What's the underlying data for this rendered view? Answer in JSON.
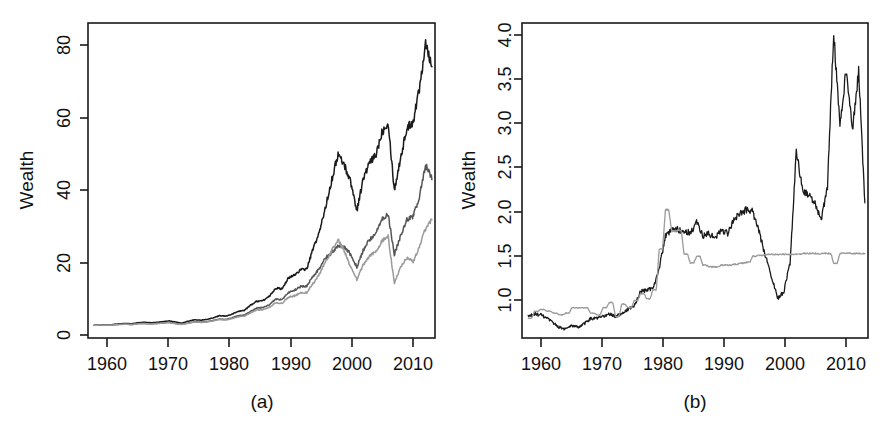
{
  "figure": {
    "panels": [
      {
        "id": "panel-a",
        "caption": "(a)",
        "ylabel": "Wealth",
        "xlabel": "",
        "y_ticks": [
          "0",
          "20",
          "40",
          "60",
          "80"
        ],
        "x_ticks": [
          "1960",
          "1970",
          "1980",
          "1990",
          "2000",
          "2010"
        ]
      },
      {
        "id": "panel-b",
        "caption": "(b)",
        "ylabel": "Wealth",
        "xlabel": "",
        "y_ticks": [
          "1.0",
          "1.5",
          "2.0",
          "2.5",
          "3.0",
          "3.5",
          "4.0"
        ],
        "x_ticks": [
          "1960",
          "1970",
          "1980",
          "1990",
          "2000",
          "2010"
        ]
      }
    ]
  },
  "colors": {
    "axis": "#1a1a1a",
    "series_dark": "#1a1a1a",
    "series_mid": "#555555",
    "series_light": "#9a9a9a",
    "background": "#ffffff"
  },
  "chart_data": [
    {
      "type": "line",
      "title": "(a)",
      "xlabel": "",
      "ylabel": "Wealth",
      "xlim": [
        1959,
        2014.5
      ],
      "ylim": [
        -2.5,
        84
      ],
      "grid": false,
      "legend": "none",
      "xticks": [
        1960,
        1970,
        1980,
        1990,
        2000,
        2010
      ],
      "yticks": [
        0,
        20,
        40,
        60,
        80
      ],
      "x": [
        1960,
        1961,
        1962,
        1963,
        1964,
        1965,
        1966,
        1967,
        1968,
        1969,
        1970,
        1971,
        1972,
        1973,
        1974,
        1975,
        1976,
        1977,
        1978,
        1979,
        1980,
        1981,
        1982,
        1983,
        1984,
        1985,
        1986,
        1987,
        1988,
        1989,
        1990,
        1991,
        1992,
        1993,
        1994,
        1995,
        1996,
        1997,
        1998,
        1999,
        2000,
        2001,
        2002,
        2003,
        2004,
        2005,
        2006,
        2007,
        2008,
        2009,
        2010,
        2011,
        2012,
        2013,
        2014
      ],
      "series": [
        {
          "name": "series-dark",
          "color": "#1a1a1a",
          "values": [
            1.0,
            1.1,
            1.0,
            1.2,
            1.4,
            1.5,
            1.4,
            1.7,
            1.8,
            1.7,
            1.8,
            2.0,
            2.2,
            1.9,
            1.6,
            2.1,
            2.5,
            2.4,
            2.6,
            3.0,
            3.6,
            3.5,
            4.0,
            4.8,
            5.1,
            6.5,
            7.6,
            7.8,
            8.9,
            11.2,
            11.0,
            13.8,
            14.8,
            16.2,
            16.5,
            22.0,
            26.5,
            33.5,
            41.0,
            48.0,
            45.0,
            40.5,
            32.5,
            41.0,
            45.5,
            47.5,
            54.0,
            57.0,
            38.0,
            47.0,
            55.0,
            57.0,
            66.0,
            79.0,
            72.0
          ]
        },
        {
          "name": "series-mid",
          "color": "#555555",
          "values": [
            1.0,
            1.05,
            0.98,
            1.1,
            1.25,
            1.3,
            1.2,
            1.45,
            1.5,
            1.4,
            1.5,
            1.65,
            1.8,
            1.5,
            1.25,
            1.6,
            1.95,
            1.85,
            2.0,
            2.3,
            2.7,
            2.6,
            3.0,
            3.6,
            3.8,
            4.8,
            5.7,
            5.9,
            6.6,
            8.2,
            8.0,
            9.9,
            10.6,
            11.6,
            11.8,
            14.5,
            16.5,
            19.5,
            21.0,
            23.0,
            22.5,
            20.5,
            17.0,
            21.5,
            24.5,
            26.0,
            30.0,
            31.5,
            20.5,
            25.5,
            30.0,
            31.0,
            36.0,
            45.0,
            41.0
          ]
        },
        {
          "name": "series-light",
          "color": "#9a9a9a",
          "values": [
            1.0,
            1.05,
            0.96,
            1.08,
            1.2,
            1.28,
            1.18,
            1.4,
            1.46,
            1.36,
            1.46,
            1.6,
            1.72,
            1.44,
            1.2,
            1.55,
            1.88,
            1.78,
            1.92,
            2.2,
            2.55,
            2.45,
            2.8,
            3.3,
            3.5,
            4.4,
            5.2,
            5.3,
            5.9,
            7.2,
            7.0,
            8.6,
            9.1,
            9.9,
            10.0,
            12.5,
            15.0,
            18.5,
            21.5,
            24.5,
            21.5,
            17.0,
            13.5,
            17.5,
            20.0,
            21.0,
            24.0,
            25.5,
            12.5,
            17.0,
            19.5,
            18.5,
            22.5,
            27.5,
            30.0
          ]
        }
      ]
    },
    {
      "type": "line",
      "title": "(b)",
      "xlabel": "",
      "ylabel": "Wealth",
      "xlim": [
        1959,
        2014.5
      ],
      "ylim": [
        0.78,
        4.32
      ],
      "grid": false,
      "legend": "none",
      "xticks": [
        1960,
        1970,
        1980,
        1990,
        2000,
        2010
      ],
      "yticks": [
        1.0,
        1.5,
        2.0,
        2.5,
        3.0,
        3.5,
        4.0
      ],
      "x": [
        1960,
        1961,
        1962,
        1963,
        1964,
        1965,
        1966,
        1967,
        1968,
        1969,
        1970,
        1971,
        1972,
        1973,
        1974,
        1975,
        1976,
        1977,
        1978,
        1979,
        1980,
        1981,
        1982,
        1983,
        1984,
        1985,
        1986,
        1987,
        1988,
        1989,
        1990,
        1991,
        1992,
        1993,
        1994,
        1995,
        1996,
        1997,
        1998,
        1999,
        2000,
        2001,
        2002,
        2003,
        2004,
        2005,
        2006,
        2007,
        2008,
        2009,
        2010,
        2011,
        2012,
        2013,
        2014
      ],
      "series": [
        {
          "name": "series-dark",
          "color": "#1a1a1a",
          "values": [
            1.02,
            1.05,
            1.04,
            1.0,
            0.95,
            0.9,
            0.88,
            0.92,
            0.9,
            0.94,
            1.0,
            1.0,
            1.02,
            1.05,
            1.02,
            1.06,
            1.1,
            1.14,
            1.3,
            1.32,
            1.34,
            1.56,
            1.92,
            1.99,
            2.0,
            1.98,
            1.96,
            2.08,
            1.93,
            1.95,
            1.9,
            2.0,
            1.95,
            2.12,
            2.18,
            2.22,
            2.2,
            1.98,
            1.72,
            1.48,
            1.22,
            1.3,
            1.62,
            2.88,
            2.45,
            2.38,
            2.3,
            2.1,
            2.48,
            4.22,
            3.15,
            3.8,
            3.1,
            3.78,
            2.3
          ]
        },
        {
          "name": "series-light",
          "color": "#9a9a9a",
          "values": [
            1.0,
            1.08,
            1.1,
            1.08,
            1.06,
            1.04,
            1.06,
            1.12,
            1.12,
            1.12,
            1.06,
            1.04,
            1.12,
            1.18,
            1.02,
            1.16,
            1.12,
            1.2,
            1.28,
            1.22,
            1.32,
            1.78,
            2.22,
            1.98,
            1.99,
            1.72,
            1.62,
            1.7,
            1.6,
            1.58,
            1.58,
            1.6,
            1.6,
            1.61,
            1.62,
            1.63,
            1.7,
            1.71,
            1.72,
            1.72,
            1.72,
            1.72,
            1.72,
            1.72,
            1.73,
            1.73,
            1.73,
            1.73,
            1.73,
            1.62,
            1.73,
            1.73,
            1.73,
            1.73,
            1.73
          ]
        }
      ]
    }
  ]
}
